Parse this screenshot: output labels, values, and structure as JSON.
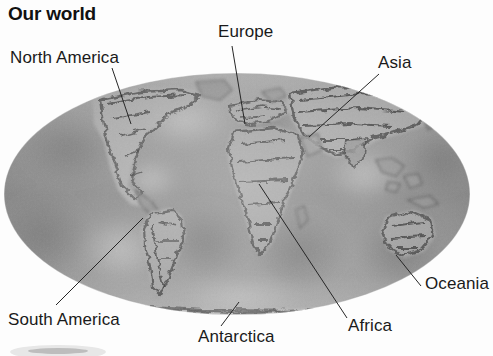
{
  "page": {
    "title": "Our world",
    "background_color": "#fdfdfd",
    "width": 493,
    "height": 356
  },
  "figure": {
    "name": "world-map",
    "projection": "Mollweide (elliptical)",
    "style": "grayscale shaded-relief photograph",
    "ellipse": {
      "center_x": 237,
      "center_y": 194,
      "radius_x": 233,
      "radius_y": 121
    },
    "colors": {
      "ocean_mid": "#9c9c9c",
      "ocean_light": "#bdbdbd",
      "ocean_dark": "#7e7e7e",
      "land_dark": "#4a4a4a",
      "land_light": "#c9c9c9",
      "leader_line": "#2a2a2a",
      "text": "#1a1a1a"
    }
  },
  "labels": [
    {
      "id": "north-america",
      "text": "North America",
      "x": 10,
      "y": 48,
      "leader": {
        "x1": 112,
        "y1": 68,
        "x2": 131,
        "y2": 124
      }
    },
    {
      "id": "europe",
      "text": "Europe",
      "x": 218,
      "y": 22,
      "leader": {
        "x1": 232,
        "y1": 46,
        "x2": 245,
        "y2": 124
      }
    },
    {
      "id": "asia",
      "text": "Asia",
      "x": 378,
      "y": 53,
      "leader": {
        "x1": 379,
        "y1": 74,
        "x2": 309,
        "y2": 137
      }
    },
    {
      "id": "oceania",
      "text": "Oceania",
      "x": 425,
      "y": 274,
      "leader": {
        "x1": 396,
        "y1": 255,
        "x2": 421,
        "y2": 286
      }
    },
    {
      "id": "africa",
      "text": "Africa",
      "x": 348,
      "y": 316,
      "leader": {
        "x1": 259,
        "y1": 184,
        "x2": 347,
        "y2": 318
      }
    },
    {
      "id": "antarctica",
      "text": "Antarctica",
      "x": 198,
      "y": 327,
      "leader": {
        "x1": 239,
        "y1": 302,
        "x2": 221,
        "y2": 326
      }
    },
    {
      "id": "south-america",
      "text": "South America",
      "x": 8,
      "y": 310,
      "leader": {
        "x1": 143,
        "y1": 218,
        "x2": 56,
        "y2": 305
      }
    }
  ],
  "continents": [
    "North America",
    "South America",
    "Europe",
    "Africa",
    "Asia",
    "Oceania",
    "Antarctica"
  ]
}
